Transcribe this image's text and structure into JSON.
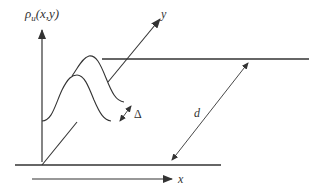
{
  "diagram": {
    "labels": {
      "rho_symbol": "ρ",
      "rho_sub": "u",
      "rho_args": "(x,y)",
      "y_axis": "y",
      "x_axis": "x",
      "delta": "Δ",
      "distance": "d"
    },
    "colors": {
      "stroke": "#333333",
      "background": "#ffffff"
    }
  }
}
